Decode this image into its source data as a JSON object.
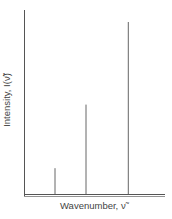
{
  "chart_data": {
    "type": "bar",
    "subtype": "stick-spectrum",
    "title": "",
    "xlabel": "Wavenumber, ν̃",
    "ylabel": "Intensity, I(ν̃)",
    "x_ticks": [],
    "y_ticks": [],
    "grid": false,
    "legend": null,
    "categories": [
      "line 1",
      "line 2",
      "line 3"
    ],
    "x_positions_relative": [
      0.22,
      0.44,
      0.74
    ],
    "values": [
      0.15,
      0.52,
      1.0
    ],
    "ylim": [
      0,
      1.05
    ]
  },
  "colors": {
    "axis": "#555555",
    "line": "#666666",
    "text": "#444444"
  },
  "labels": {
    "x": "Wavenumber, ν̃",
    "y": "Intensity, I(ν̃)"
  }
}
